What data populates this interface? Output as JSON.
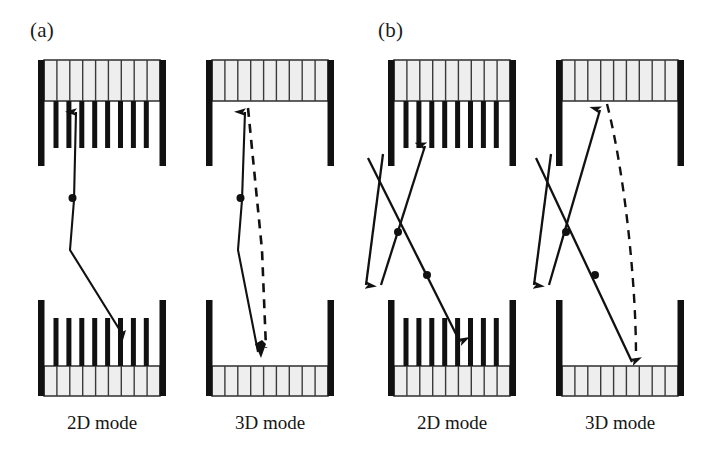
{
  "figure": {
    "background_color": "#ffffff",
    "ink_color": "#111111",
    "well_fill_color": "#eeeeee",
    "well_line_color": "#3a3a3a",
    "width": 702,
    "height": 451
  },
  "panels": [
    {
      "id": "a",
      "label": "(a)",
      "label_x": 30,
      "label_y": 18,
      "subpanels": [
        {
          "id": "a-2d",
          "caption": "2D mode",
          "caption_x": 100,
          "caption_y": 412,
          "has_comb_teeth": true,
          "has_dashed_path": true,
          "crossing_beams": false,
          "left": 38,
          "width": 128
        },
        {
          "id": "a-3d",
          "caption": "3D mode",
          "caption_x": 268,
          "caption_y": 412,
          "has_comb_teeth": false,
          "has_dashed_path": true,
          "crossing_beams": false,
          "left": 206,
          "width": 128
        }
      ]
    },
    {
      "id": "b",
      "label": "(b)",
      "label_x": 378,
      "label_y": 18,
      "subpanels": [
        {
          "id": "b-2d",
          "caption": "2D mode",
          "caption_x": 450,
          "caption_y": 412,
          "has_comb_teeth": true,
          "has_dashed_path": false,
          "crossing_beams": true,
          "left": 388,
          "width": 128
        },
        {
          "id": "b-3d",
          "caption": "3D mode",
          "caption_x": 618,
          "caption_y": 412,
          "has_comb_teeth": false,
          "has_dashed_path": true,
          "crossing_beams": true,
          "left": 556,
          "width": 128
        }
      ]
    }
  ],
  "structure": {
    "top_well_top": 60,
    "top_well_bottom": 101,
    "top_teeth_bottom": 148,
    "top_wall_bottom": 166,
    "bottom_wall_top": 300,
    "bottom_teeth_top": 318,
    "bottom_well_top": 366,
    "bottom_well_bottom": 396,
    "well_cells": 9,
    "comb_teeth": 9,
    "wall_thickness": 6,
    "tooth_thickness": 5
  },
  "legend_note": {
    "well_description": "quantum well region",
    "teeth_description": "lateral confinement barriers",
    "solid_path_description": "carrier trajectory",
    "dashed_path_description": "alternate trajectory",
    "dot_description": "scattering event"
  }
}
